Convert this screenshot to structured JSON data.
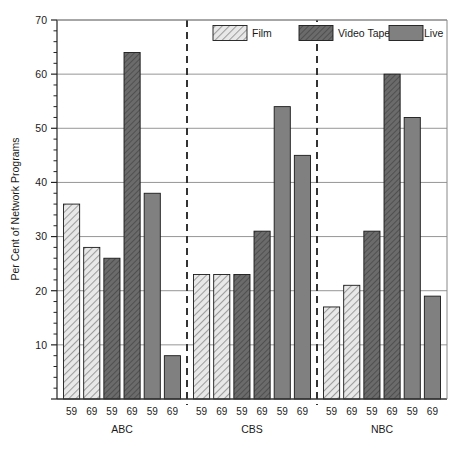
{
  "chart_data": {
    "type": "bar",
    "title": "",
    "xlabel": "",
    "ylabel": "Per Cent of Network Programs",
    "ylim": [
      0,
      70
    ],
    "y_major_ticks": [
      0,
      10,
      20,
      30,
      40,
      50,
      60,
      70
    ],
    "y_major_tick_labels": [
      "",
      "10",
      "20",
      "30",
      "40",
      "50",
      "60",
      "70"
    ],
    "y_minor_tick_step": 2,
    "grid": "horizontal-major-only",
    "legend_position": "top-right-inside",
    "legend": [
      {
        "name": "Film",
        "fill": "light-hatch",
        "color": "#e3e3e3"
      },
      {
        "name": "Video Tape",
        "fill": "dark-hatch",
        "color": "#6e6e6e"
      },
      {
        "name": "Live",
        "fill": "solid",
        "color": "#808080"
      }
    ],
    "group_separator_style": "dashed-vertical",
    "categories": [
      "59",
      "69"
    ],
    "groups": [
      {
        "name": "ABC",
        "series": [
          {
            "name": "Film",
            "values": [
              36,
              28
            ]
          },
          {
            "name": "Video Tape",
            "values": [
              26,
              64
            ]
          },
          {
            "name": "Live",
            "values": [
              38,
              8
            ]
          }
        ]
      },
      {
        "name": "CBS",
        "series": [
          {
            "name": "Film",
            "values": [
              23,
              23
            ]
          },
          {
            "name": "Video Tape",
            "values": [
              23,
              31
            ]
          },
          {
            "name": "Live",
            "values": [
              54,
              45
            ]
          }
        ]
      },
      {
        "name": "NBC",
        "series": [
          {
            "name": "Film",
            "values": [
              17,
              21
            ]
          },
          {
            "name": "Video Tape",
            "values": [
              31,
              60
            ]
          },
          {
            "name": "Live",
            "values": [
              52,
              19
            ]
          }
        ]
      }
    ],
    "bars": [
      {
        "group": "ABC",
        "series": "Film",
        "year": "59",
        "value": 36
      },
      {
        "group": "ABC",
        "series": "Film",
        "year": "69",
        "value": 28
      },
      {
        "group": "ABC",
        "series": "Video Tape",
        "year": "59",
        "value": 26
      },
      {
        "group": "ABC",
        "series": "Video Tape",
        "year": "69",
        "value": 64
      },
      {
        "group": "ABC",
        "series": "Live",
        "year": "59",
        "value": 38
      },
      {
        "group": "ABC",
        "series": "Live",
        "year": "69",
        "value": 8
      },
      {
        "group": "CBS",
        "series": "Film",
        "year": "59",
        "value": 23
      },
      {
        "group": "CBS",
        "series": "Film",
        "year": "69",
        "value": 23
      },
      {
        "group": "CBS",
        "series": "Video Tape",
        "year": "59",
        "value": 23
      },
      {
        "group": "CBS",
        "series": "Video Tape",
        "year": "69",
        "value": 31
      },
      {
        "group": "CBS",
        "series": "Live",
        "year": "59",
        "value": 54
      },
      {
        "group": "CBS",
        "series": "Live",
        "year": "69",
        "value": 45
      },
      {
        "group": "NBC",
        "series": "Film",
        "year": "59",
        "value": 17
      },
      {
        "group": "NBC",
        "series": "Film",
        "year": "69",
        "value": 21
      },
      {
        "group": "NBC",
        "series": "Video Tape",
        "year": "59",
        "value": 31
      },
      {
        "group": "NBC",
        "series": "Video Tape",
        "year": "69",
        "value": 60
      },
      {
        "group": "NBC",
        "series": "Live",
        "year": "59",
        "value": 52
      },
      {
        "group": "NBC",
        "series": "Live",
        "year": "69",
        "value": 19
      }
    ]
  },
  "colors": {
    "film_fill": "#e8e8e8",
    "film_hatch": "#9a9a9a",
    "videotape_fill": "#707070",
    "videotape_hatch": "#4a4a4a",
    "live_fill": "#808080",
    "outline": "#1a1a1a",
    "grid": "#888888",
    "frame": "#444444",
    "separator": "#333333",
    "background": "#ffffff"
  }
}
